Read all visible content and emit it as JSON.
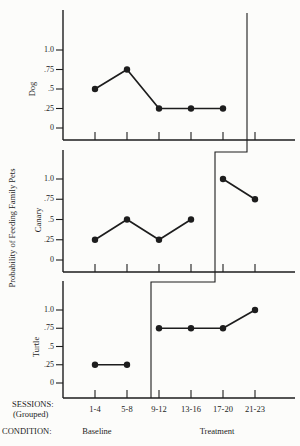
{
  "chart_data": {
    "type": "line",
    "title": "",
    "ylabel": "Probability of Feeding Family Pets",
    "xlabel_line1": "SESSIONS:",
    "xlabel_line2": "(Grouped)",
    "condition_label": "CONDITION:",
    "categories": [
      "1-4",
      "5-8",
      "9-12",
      "13-16",
      "17-20",
      "21-23"
    ],
    "y_tick_labels": [
      "1.0",
      ".75",
      ".5",
      ".25",
      "0"
    ],
    "y_tick_values": [
      1.0,
      0.75,
      0.5,
      0.25,
      0
    ],
    "ylim": [
      0,
      1.3
    ],
    "grid": false,
    "legend": "none",
    "conditions": [
      {
        "label": "Baseline"
      },
      {
        "label": "Treatment"
      }
    ],
    "panels": [
      {
        "name": "Dog",
        "phase_change_between": [
          "17-20",
          "21-23"
        ],
        "segments": [
          {
            "condition": "Baseline",
            "start_category": "1-4",
            "values": [
              0.5,
              0.75,
              0.25,
              0.25,
              0.25
            ]
          }
        ]
      },
      {
        "name": "Canary",
        "phase_change_between": [
          "13-16",
          "17-20"
        ],
        "segments": [
          {
            "condition": "Baseline",
            "start_category": "1-4",
            "values": [
              0.25,
              0.5,
              0.25,
              0.5
            ]
          },
          {
            "condition": "Treatment",
            "start_category": "17-20",
            "values": [
              1.0,
              0.75
            ]
          }
        ]
      },
      {
        "name": "Turtle",
        "phase_change_between": [
          "5-8",
          "9-12"
        ],
        "segments": [
          {
            "condition": "Baseline",
            "start_category": "1-4",
            "values": [
              0.25,
              0.25
            ]
          },
          {
            "condition": "Treatment",
            "start_category": "9-12",
            "values": [
              0.75,
              0.75,
              0.75,
              1.0
            ]
          }
        ]
      }
    ],
    "colors": {
      "line": "#1d1d1d",
      "background": "#fcfcfa"
    }
  }
}
